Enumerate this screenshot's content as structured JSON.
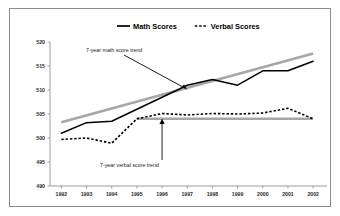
{
  "chart_data": {
    "type": "line",
    "title": "",
    "subtitle": "",
    "xlabel": "",
    "ylabel": "",
    "categories": [
      "1992",
      "1993",
      "1994",
      "1995",
      "1996",
      "1997",
      "1998",
      "1999",
      "2000",
      "2001",
      "2002"
    ],
    "ylim": [
      490,
      520
    ],
    "yticks": [
      490,
      495,
      500,
      505,
      510,
      515,
      520
    ],
    "ytick_labels": [
      "490",
      "495",
      "500",
      "505",
      "510",
      "515",
      "520"
    ],
    "grid": false,
    "legend_position": "top-center",
    "series": [
      {
        "name": "Math Scores",
        "style": "solid",
        "color": "#000000",
        "values": [
          501,
          503.2,
          503.5,
          506,
          508.5,
          511,
          512.2,
          511,
          514,
          514,
          516
        ]
      },
      {
        "name": "Verbal Scores",
        "style": "dashed",
        "color": "#000000",
        "values": [
          499.7,
          500,
          498.9,
          504,
          505.1,
          504.8,
          505.1,
          505,
          505.2,
          506.2,
          504
        ]
      }
    ],
    "trend_lines": [
      {
        "name": "7-year math score trend",
        "color": "#a6a6a6",
        "x_start": "1992",
        "x_end": "2002",
        "y_start": 503.3,
        "y_end": 517.6
      },
      {
        "name": "7-year verbal score trend",
        "color": "#a6a6a6",
        "x_start": "1995",
        "x_end": "2002",
        "y_start": 504,
        "y_end": 504
      }
    ],
    "annotations": [
      {
        "text": "7-year math score trend",
        "target_series": "Math Scores",
        "target_x": "1997",
        "target_y": 510
      },
      {
        "text": "7-year verbal score trend",
        "target_series": "Verbal Scores",
        "target_x": "1996",
        "target_y": 504
      }
    ]
  },
  "legend": {
    "items": [
      {
        "label": "Math Scores",
        "style": "solid"
      },
      {
        "label": "Verbal Scores",
        "style": "dashed"
      }
    ]
  },
  "colors": {
    "series_line": "#000000",
    "trend_line": "#a6a6a6",
    "axis": "#9a9a9a",
    "frame": "#8d8d8d",
    "background": "#ffffff"
  }
}
